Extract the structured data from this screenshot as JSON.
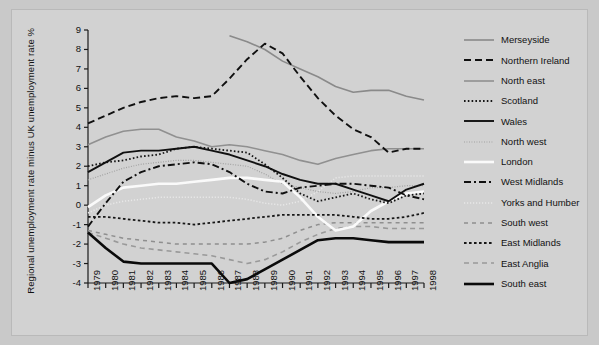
{
  "chart_data": {
    "type": "line",
    "title": "",
    "xlabel": "",
    "ylabel": "Regional unemployment rate minus UK unemployment rate %",
    "x": [
      1979,
      1980,
      1981,
      1982,
      1983,
      1984,
      1985,
      1986,
      1987,
      1988,
      1989,
      1990,
      1991,
      1992,
      1993,
      1994,
      1995,
      1996,
      1997,
      1998
    ],
    "xtick_labels": [
      "1979",
      "1980",
      "1981",
      "1982",
      "1983",
      "1984",
      "1985",
      "1986",
      "1987",
      "1988",
      "1989",
      "1990",
      "1991",
      "1992",
      "1993",
      "1994",
      "1995",
      "1996",
      "1997",
      "1998"
    ],
    "ytick_labels": [
      "9",
      "8",
      "7",
      "6",
      "5",
      "4",
      "3",
      "2",
      "1",
      "0",
      "-1",
      "-2",
      "-3",
      "-4"
    ],
    "ylim": [
      -4,
      9
    ],
    "xlim": [
      1979,
      1998
    ],
    "grid": false,
    "legend_position": "right",
    "series": [
      {
        "name": "Merseyside",
        "color": "#8a8a8a",
        "width": 1.6,
        "dash": "none",
        "start_year": 1987,
        "values": [
          null,
          null,
          null,
          null,
          null,
          null,
          null,
          null,
          8.7,
          8.4,
          8.0,
          7.4,
          7.0,
          6.6,
          6.1,
          5.8,
          5.9,
          5.9,
          5.6,
          5.4
        ]
      },
      {
        "name": "Northern Ireland",
        "color": "#101010",
        "width": 1.9,
        "dash": "7,4",
        "start_year": 1979,
        "values": [
          4.2,
          4.6,
          5.0,
          5.3,
          5.5,
          5.6,
          5.5,
          5.6,
          6.5,
          7.5,
          8.3,
          7.8,
          6.6,
          5.5,
          4.6,
          3.9,
          3.5,
          2.7,
          2.9,
          2.9
        ]
      },
      {
        "name": "North east",
        "color": "#909090",
        "width": 1.6,
        "dash": "none",
        "start_year": 1979,
        "values": [
          3.1,
          3.5,
          3.8,
          3.9,
          3.9,
          3.5,
          3.3,
          3.0,
          3.1,
          3.0,
          2.8,
          2.6,
          2.3,
          2.1,
          2.4,
          2.6,
          2.8,
          2.9,
          2.9,
          2.9
        ]
      },
      {
        "name": "Scotland",
        "color": "#161616",
        "width": 1.8,
        "dash": "1.6,2.2",
        "start_year": 1979,
        "values": [
          2.0,
          2.2,
          2.3,
          2.5,
          2.6,
          2.9,
          3.0,
          2.9,
          2.8,
          2.7,
          2.1,
          1.4,
          0.6,
          0.2,
          0.4,
          0.6,
          0.3,
          0.1,
          0.5,
          0.6
        ]
      },
      {
        "name": "Wales",
        "color": "#101010",
        "width": 1.9,
        "dash": "none",
        "start_year": 1979,
        "values": [
          1.7,
          2.2,
          2.7,
          2.8,
          2.8,
          2.9,
          3.0,
          2.8,
          2.6,
          2.3,
          2.0,
          1.6,
          1.3,
          1.1,
          1.1,
          0.8,
          0.5,
          0.2,
          0.8,
          1.1
        ]
      },
      {
        "name": "North west",
        "color": "#9e9e9e",
        "width": 1.2,
        "dash": "0.9,1.6",
        "start_year": 1979,
        "values": [
          1.3,
          1.6,
          1.9,
          2.1,
          2.2,
          2.3,
          2.3,
          2.2,
          2.1,
          2.0,
          1.6,
          1.1,
          0.9,
          0.7,
          0.6,
          0.7,
          0.9,
          0.9,
          1.0,
          1.0
        ]
      },
      {
        "name": "London",
        "color": "#fafafa",
        "width": 2.6,
        "dash": "none",
        "start_year": 1979,
        "values": [
          -0.1,
          0.5,
          0.9,
          1.0,
          1.1,
          1.1,
          1.2,
          1.3,
          1.4,
          1.4,
          1.3,
          1.2,
          0.4,
          -0.6,
          -1.3,
          -1.1,
          -0.3,
          0.2,
          0.6,
          0.7
        ]
      },
      {
        "name": "West Midlands",
        "color": "#101010",
        "width": 1.9,
        "dash": "7,3,2,3",
        "start_year": 1979,
        "values": [
          -1.1,
          0.1,
          1.2,
          1.7,
          2.0,
          2.1,
          2.2,
          2.1,
          1.7,
          1.1,
          0.7,
          0.6,
          0.9,
          1.0,
          1.1,
          1.1,
          1.0,
          0.9,
          0.5,
          0.3
        ]
      },
      {
        "name": "Yorks and Humber",
        "color": "#e8e8e8",
        "width": 1.5,
        "dash": "1.2,1.8",
        "start_year": 1979,
        "values": [
          -0.4,
          0.0,
          0.2,
          0.3,
          0.4,
          0.4,
          0.4,
          0.4,
          0.4,
          0.3,
          0.1,
          0.0,
          0.2,
          0.7,
          1.4,
          1.5,
          1.5,
          1.5,
          1.5,
          1.5
        ]
      },
      {
        "name": "South west",
        "color": "#8f8f8f",
        "width": 1.5,
        "dash": "4,4",
        "start_year": 1979,
        "values": [
          -1.3,
          -1.5,
          -1.7,
          -1.8,
          -1.9,
          -2.0,
          -2.0,
          -2.0,
          -2.0,
          -2.0,
          -1.9,
          -1.7,
          -1.3,
          -1.0,
          -0.9,
          -0.9,
          -0.9,
          -0.9,
          -0.9,
          -0.9
        ]
      },
      {
        "name": "East Midlands",
        "color": "#171717",
        "width": 1.8,
        "dash": "2.6,2.4",
        "start_year": 1979,
        "values": [
          -0.6,
          -0.6,
          -0.7,
          -0.8,
          -0.9,
          -0.9,
          -1.0,
          -0.9,
          -0.8,
          -0.7,
          -0.6,
          -0.5,
          -0.5,
          -0.5,
          -0.5,
          -0.6,
          -0.7,
          -0.7,
          -0.6,
          -0.4
        ]
      },
      {
        "name": "East Anglia",
        "color": "#999999",
        "width": 1.6,
        "dash": "5,4",
        "start_year": 1979,
        "values": [
          -1.4,
          -1.7,
          -2.0,
          -2.2,
          -2.3,
          -2.4,
          -2.5,
          -2.6,
          -2.8,
          -3.0,
          -2.8,
          -2.4,
          -1.9,
          -1.5,
          -1.2,
          -1.1,
          -1.1,
          -1.2,
          -1.2,
          -1.2
        ]
      },
      {
        "name": "South east",
        "color": "#0a0a0a",
        "width": 2.6,
        "dash": "none",
        "start_year": 1979,
        "values": [
          -1.4,
          -2.2,
          -2.9,
          -3.0,
          -3.0,
          -3.0,
          -3.0,
          -3.0,
          -4.0,
          -3.8,
          -3.3,
          -2.8,
          -2.3,
          -1.8,
          -1.7,
          -1.7,
          -1.8,
          -1.9,
          -1.9,
          -1.9
        ]
      }
    ]
  }
}
